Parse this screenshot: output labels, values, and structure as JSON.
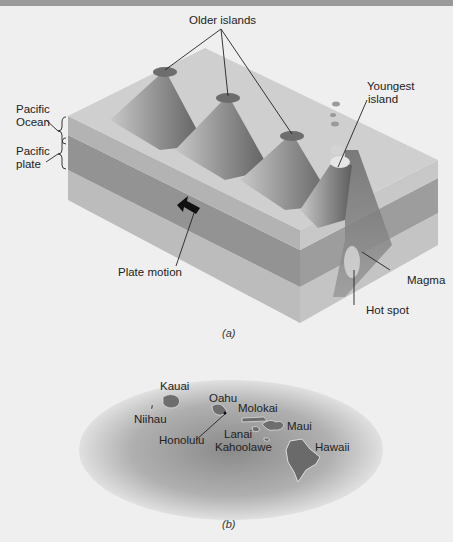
{
  "figure": {
    "part_a": {
      "caption": "(a)",
      "labels": {
        "older_islands": "Older islands",
        "youngest_island_1": "Youngest",
        "youngest_island_2": "island",
        "pacific_ocean_1": "Pacific",
        "pacific_ocean_2": "Ocean",
        "pacific_plate_1": "Pacific",
        "pacific_plate_2": "plate",
        "plate_motion": "Plate motion",
        "magma": "Magma",
        "hot_spot": "Hot spot"
      }
    },
    "part_b": {
      "caption": "(b)",
      "islands": {
        "kauai": "Kauai",
        "niihau": "Niihau",
        "oahu": "Oahu",
        "honolulu": "Honolulu",
        "molokai": "Molokai",
        "lanai": "Lanai",
        "kahoolawe": "Kahoolawe",
        "maui": "Maui",
        "hawaii": "Hawaii"
      }
    }
  },
  "colors": {
    "background": "#efefef",
    "top_bar": "#9a9a9a",
    "ocean_top": "#c9c9c9",
    "plate": "#8f8f8f",
    "mantle": "#b5b5b5",
    "island": "#6e6e6e"
  }
}
